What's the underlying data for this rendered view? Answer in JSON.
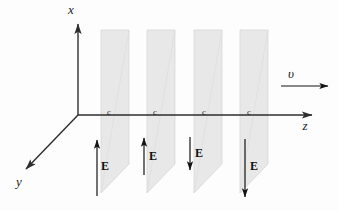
{
  "figure": {
    "background_color": "#fdfdfd",
    "plane_fill_color": "#e6e6e6",
    "plane_edge_color": "#d2d2d2",
    "axis_color": "#2e2e2e",
    "arrow_color": "#141414"
  },
  "axes": {
    "x": {
      "label": "x",
      "label_x": 71,
      "label_y": 14
    },
    "y": {
      "label": "y",
      "label_x": 19,
      "label_y": 186
    },
    "z": {
      "label": "z",
      "label_x": 305,
      "label_y": 130
    }
  },
  "velocity": {
    "label": "υ",
    "label_x": 291,
    "label_y": 78
  },
  "wavefronts": [
    {
      "label": "c",
      "label_x": 109,
      "label_y": 115
    },
    {
      "label": "c",
      "label_x": 155,
      "label_y": 115
    },
    {
      "label": "c",
      "label_x": 204,
      "label_y": 115
    },
    {
      "label": "c",
      "label_x": 249,
      "label_y": 115
    }
  ],
  "field_arrows": [
    {
      "label": "E",
      "direction": "up",
      "label_x": 101,
      "label_y": 170
    },
    {
      "label": "E",
      "direction": "up",
      "label_x": 149,
      "label_y": 160
    },
    {
      "label": "E",
      "direction": "down",
      "label_x": 195,
      "label_y": 157
    },
    {
      "label": "E",
      "direction": "down",
      "label_x": 250,
      "label_y": 170
    }
  ]
}
